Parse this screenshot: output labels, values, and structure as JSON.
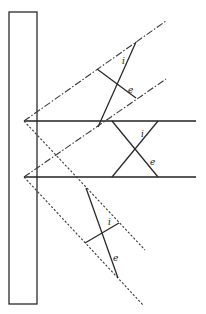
{
  "diagram": {
    "title": "",
    "labels": {
      "upper_i": "i",
      "upper_e": "e",
      "middle_i": "i",
      "middle_e": "e",
      "lower_i": "i",
      "lower_e": "e"
    },
    "colors": {
      "line": "#2a2a2a",
      "background": "#ffffff"
    }
  }
}
